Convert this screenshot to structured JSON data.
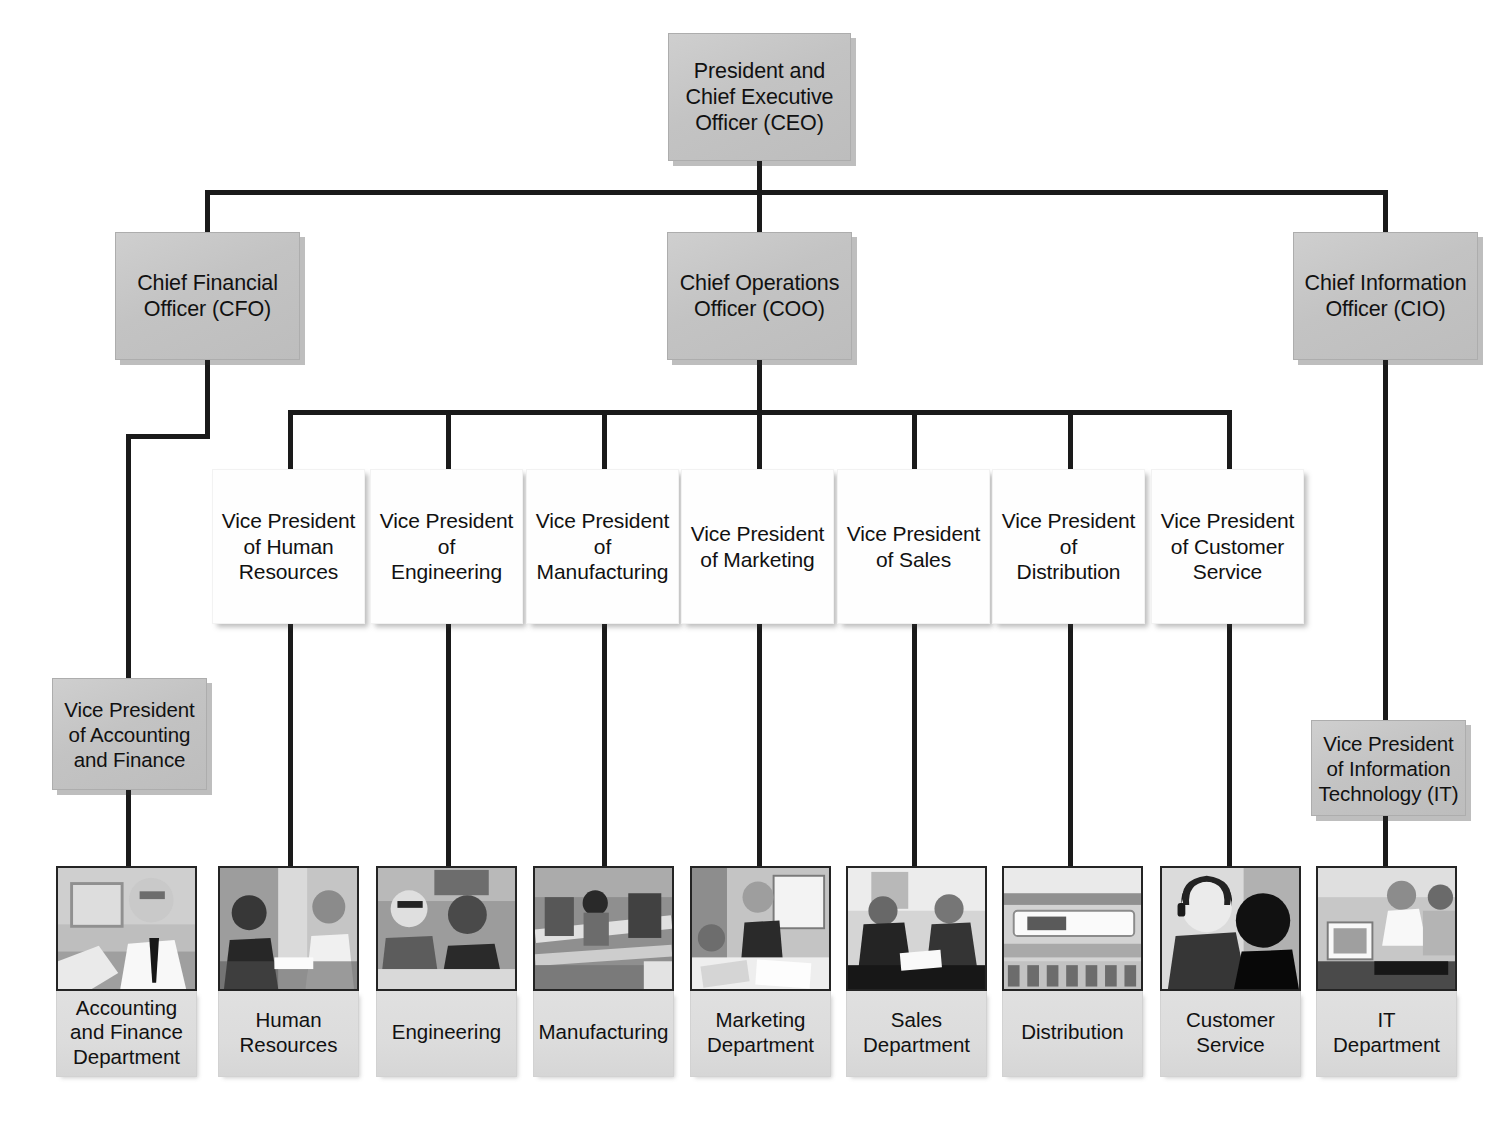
{
  "diagram": {
    "type": "org-chart",
    "colors": {
      "gray_box_fill": "#c6c6c6",
      "white_box_fill": "#fefefe",
      "label_fill": "#dcdcdc",
      "line": "#1a1a1a",
      "text": "#111111"
    }
  },
  "ceo": {
    "label": "President and\nChief Executive\nOfficer (CEO)",
    "line1": "President and",
    "line2": "Chief Executive",
    "line3": "Officer (CEO)"
  },
  "executives": [
    {
      "id": "cfo",
      "line1": "Chief Financial",
      "line2": "Officer (CFO)"
    },
    {
      "id": "coo",
      "line1": "Chief Operations",
      "line2": "Officer (COO)"
    },
    {
      "id": "cio",
      "line1": "Chief Information",
      "line2": "Officer (CIO)"
    }
  ],
  "vice_presidents": [
    {
      "id": "vp-human-resources",
      "line1": "Vice President",
      "line2": "of Human",
      "line3": "Resources"
    },
    {
      "id": "vp-engineering",
      "line1": "Vice President",
      "line2": "of",
      "line3": "Engineering"
    },
    {
      "id": "vp-manufacturing",
      "line1": "Vice President",
      "line2": "of",
      "line3": "Manufacturing"
    },
    {
      "id": "vp-marketing",
      "line1": "Vice President",
      "line2": "of Marketing",
      "line3": ""
    },
    {
      "id": "vp-sales",
      "line1": "Vice President",
      "line2": "of Sales",
      "line3": ""
    },
    {
      "id": "vp-distribution",
      "line1": "Vice President",
      "line2": "of",
      "line3": "Distribution"
    },
    {
      "id": "vp-customer-service",
      "line1": "Vice President",
      "line2": "of Customer",
      "line3": "Service"
    }
  ],
  "vp_accounting": {
    "id": "vp-accounting-and-finance",
    "line1": "Vice President",
    "line2": "of Accounting",
    "line3": "and Finance"
  },
  "vp_it": {
    "id": "vp-information-technology",
    "line1": "Vice President",
    "line2": "of Information",
    "line3": "Technology (IT)"
  },
  "departments": [
    {
      "id": "accounting-and-finance-department",
      "line1": "Accounting",
      "line2": "and Finance",
      "line3": "Department",
      "photo": "office-worker-photo"
    },
    {
      "id": "human-resources-department",
      "line1": "Human",
      "line2": "Resources",
      "line3": "",
      "photo": "interview-meeting-photo"
    },
    {
      "id": "engineering-department",
      "line1": "Engineering",
      "line2": "",
      "line3": "",
      "photo": "engineers-at-desk-photo"
    },
    {
      "id": "manufacturing-department",
      "line1": "Manufacturing",
      "line2": "",
      "line3": "",
      "photo": "factory-floor-photo"
    },
    {
      "id": "marketing-department",
      "line1": "Marketing",
      "line2": "Department",
      "line3": "",
      "photo": "marketing-presentation-photo"
    },
    {
      "id": "sales-department",
      "line1": "Sales",
      "line2": "Department",
      "line3": "",
      "photo": "sales-handshake-photo"
    },
    {
      "id": "distribution-department",
      "line1": "Distribution",
      "line2": "",
      "line3": "",
      "photo": "conveyor-belt-photo"
    },
    {
      "id": "customer-service-department",
      "line1": "Customer",
      "line2": "Service",
      "line3": "",
      "photo": "headset-agent-photo"
    },
    {
      "id": "it-department",
      "line1": "IT",
      "line2": "Department",
      "line3": "",
      "photo": "it-workstation-photo"
    }
  ]
}
